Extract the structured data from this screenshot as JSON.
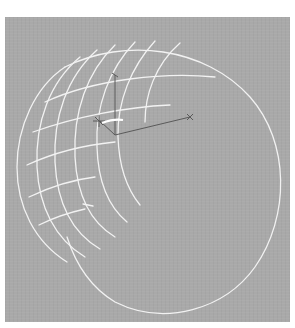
{
  "viewport": {
    "background_color": "#a9a9a9",
    "wireframe_color": "#f2f2f2",
    "gizmo_color": "#5a5a5a"
  },
  "object": {
    "type": "cylinder",
    "render_mode": "wireframe",
    "cap_grid_rows": 5,
    "cap_grid_cols": 6
  },
  "gizmo": {
    "axes": [
      "X",
      "Y",
      "Z"
    ]
  }
}
